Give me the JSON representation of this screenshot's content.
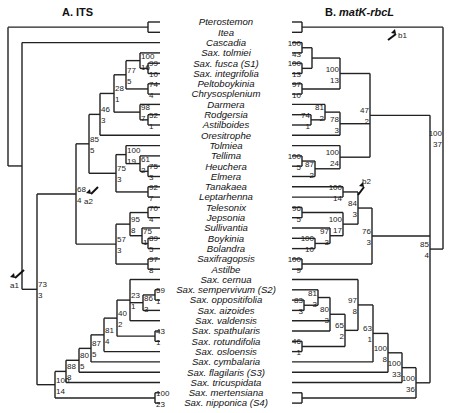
{
  "figure": {
    "panel_a_title": "A. ITS",
    "panel_b_title_prefix": "B. ",
    "panel_b_title_italic": "matK-rbcL",
    "arrows": {
      "a1": "a1",
      "a2": "a2",
      "b1": "b1",
      "b2": "b2"
    }
  },
  "taxa": [
    "Pterostemon",
    "Itea",
    "Cascadia",
    "Sax. tolmiei",
    "Sax. fusca (S1)",
    "Sax. integrifolia",
    "Peltoboykinia",
    "Chrysosplenium",
    "Darmera",
    "Rodgersia",
    "Astilboides",
    "Oresitrophe",
    "Tolmiea",
    "Tellima",
    "Heuchera",
    "Elmera",
    "Tanakaea",
    "Leptarhenna",
    "Telesonix",
    "Jepsonia",
    "Sullivantia",
    "Boykinia",
    "Bolandra",
    "Saxifragopsis",
    "Astilbe",
    "Sax. cernua",
    "Sax. sempervivum (S2)",
    "Sax. oppositifolia",
    "Sax. aizoides",
    "Sax. valdensis",
    "Sax. spathularis",
    "Sax. rotundifolia",
    "Sax. osloensis",
    "Sax. cymbalaria",
    "Sax. flagilaris (S3)",
    "Sax. tricuspidata",
    "Sax. mertensiana",
    "Sax. nipponica (S4)"
  ],
  "tree_a": {
    "segments": [
      [
        8,
        22,
        8,
        152
      ],
      [
        8,
        22,
        148,
        22
      ],
      [
        148,
        17,
        148,
        27
      ],
      [
        148,
        17,
        160,
        17
      ],
      [
        148,
        27,
        160,
        27
      ],
      [
        8,
        152,
        22,
        152
      ],
      [
        22,
        43,
        22,
        255
      ],
      [
        22,
        43,
        160,
        43
      ],
      [
        22,
        255,
        37,
        255
      ],
      [
        37,
        72,
        37,
        370
      ],
      [
        37,
        72,
        76,
        72
      ],
      [
        76,
        57,
        76,
        123
      ],
      [
        76,
        57,
        89,
        57
      ],
      [
        89,
        35,
        89,
        80
      ],
      [
        89,
        35,
        100,
        35
      ],
      [
        100,
        35,
        100,
        115
      ],
      [
        100,
        115,
        160,
        115
      ],
      [
        100,
        92,
        120,
        92
      ],
      [
        120,
        92,
        120,
        115
      ],
      [
        100,
        35,
        101,
        35
      ],
      [
        101,
        82,
        101,
        35
      ],
      [
        101,
        67,
        126,
        67
      ],
      [
        126,
        50,
        126,
        80
      ],
      [
        126,
        50,
        140,
        50
      ],
      [
        140,
        50,
        140,
        72
      ],
      [
        140,
        72,
        160,
        72
      ],
      [
        140,
        53,
        142,
        53
      ],
      [
        142,
        53,
        142,
        53
      ],
      [
        126,
        80,
        140,
        80
      ],
      [
        120,
        95,
        140,
        95
      ],
      [
        140,
        95,
        140,
        115
      ],
      [
        140,
        104,
        148,
        104
      ],
      [
        148,
        99,
        148,
        109
      ],
      [
        148,
        99,
        160,
        99
      ],
      [
        148,
        109,
        160,
        109
      ],
      [
        140,
        53,
        148,
        53
      ],
      [
        148,
        53,
        148,
        53
      ],
      [
        76,
        123,
        101,
        123
      ],
      [
        116,
        123,
        116,
        144
      ],
      [
        116,
        144,
        160,
        144
      ],
      [
        101,
        123,
        116,
        123
      ],
      [
        116,
        134,
        116,
        175
      ],
      [
        116,
        164,
        144,
        164
      ],
      [
        144,
        154,
        144,
        175
      ],
      [
        144,
        154,
        160,
        154
      ],
      [
        144,
        175,
        160,
        175
      ],
      [
        116,
        175,
        126,
        175
      ],
      [
        126,
        160,
        126,
        185
      ],
      [
        126,
        185,
        160,
        185
      ],
      [
        37,
        185,
        76,
        185
      ],
      [
        76,
        185,
        76,
        195
      ],
      [
        76,
        195,
        76,
        246
      ],
      [
        76,
        215,
        116,
        215
      ],
      [
        116,
        201,
        116,
        246
      ],
      [
        116,
        201,
        130,
        201
      ],
      [
        130,
        185,
        130,
        221
      ],
      [
        130,
        185,
        148,
        185
      ],
      [
        148,
        180,
        148,
        190
      ],
      [
        148,
        180,
        160,
        180
      ],
      [
        148,
        190,
        160,
        190
      ],
      [
        130,
        221,
        142,
        221
      ],
      [
        142,
        206,
        142,
        226
      ],
      [
        142,
        206,
        160,
        206
      ],
      [
        142,
        226,
        148,
        226
      ],
      [
        148,
        221,
        148,
        231
      ],
      [
        148,
        221,
        160,
        221
      ],
      [
        148,
        231,
        160,
        231
      ],
      [
        116,
        246,
        148,
        246
      ],
      [
        148,
        241,
        148,
        251
      ],
      [
        148,
        241,
        160,
        241
      ],
      [
        148,
        251,
        160,
        251
      ]
    ]
  },
  "labels_a": [
    {
      "x": 5,
      "y": 66,
      "t": "92",
      "u": true
    },
    {
      "x": 6,
      "y": 74,
      "t": "6"
    },
    {
      "x": 127,
      "y": 59,
      "t": "100"
    },
    {
      "x": 124,
      "y": 73,
      "t": "16"
    },
    {
      "x": 143,
      "y": 59,
      "t": "99"
    },
    {
      "x": 145,
      "y": 75,
      "t": "10"
    },
    {
      "x": 118,
      "y": 69,
      "t": "77"
    },
    {
      "x": 119,
      "y": 83,
      "t": "5"
    },
    {
      "x": 140,
      "y": 85,
      "t": "74"
    },
    {
      "x": 140,
      "y": 96,
      "t": "4"
    },
    {
      "x": 102,
      "y": 89,
      "t": "28"
    },
    {
      "x": 105,
      "y": 101,
      "t": "1"
    },
    {
      "x": 120,
      "y": 101,
      "t": "98"
    },
    {
      "x": 122,
      "y": 114,
      "t": "7"
    },
    {
      "x": 146,
      "y": 116,
      "t": "52"
    },
    {
      "x": 147,
      "y": 127,
      "t": "1"
    },
    {
      "x": 90,
      "y": 118,
      "t": "46"
    },
    {
      "x": 92,
      "y": 130,
      "t": "3"
    },
    {
      "x": 78,
      "y": 146,
      "t": "85"
    },
    {
      "x": 80,
      "y": 158,
      "t": "5"
    },
    {
      "x": 126,
      "y": 150,
      "t": "61"
    },
    {
      "x": 130,
      "y": 161,
      "t": "2"
    },
    {
      "x": 140,
      "y": 161,
      "t": "75"
    },
    {
      "x": 144,
      "y": 173,
      "t": "3"
    },
    {
      "x": 118,
      "y": 163,
      "t": "100"
    },
    {
      "x": 118,
      "y": 175,
      "t": "19"
    },
    {
      "x": 98,
      "y": 174,
      "t": "75"
    },
    {
      "x": 101,
      "y": 187,
      "t": "3"
    },
    {
      "x": 130,
      "y": 189,
      "t": "92"
    },
    {
      "x": 133,
      "y": 200,
      "t": "7"
    },
    {
      "x": 52,
      "y": 193,
      "t": "68"
    },
    {
      "x": 55,
      "y": 206,
      "t": "4"
    },
    {
      "x": 137,
      "y": 210,
      "t": "70"
    },
    {
      "x": 139,
      "y": 222,
      "t": "4"
    },
    {
      "x": 118,
      "y": 220,
      "t": "95"
    },
    {
      "x": 121,
      "y": 233,
      "t": "8"
    },
    {
      "x": 133,
      "y": 232,
      "t": "75"
    },
    {
      "x": 134,
      "y": 244,
      "t": "1"
    },
    {
      "x": 145,
      "y": 241,
      "t": "89"
    },
    {
      "x": 146,
      "y": 253,
      "t": "5"
    },
    {
      "x": 92,
      "y": 241,
      "t": "57"
    },
    {
      "x": 94,
      "y": 254,
      "t": "3"
    },
    {
      "x": 132,
      "y": 259,
      "t": "97"
    },
    {
      "x": 133,
      "y": 270,
      "t": "8"
    },
    {
      "x": 26,
      "y": 252,
      "t": "73"
    },
    {
      "x": 28,
      "y": 264,
      "t": "3"
    },
    {
      "x": 91,
      "y": 213,
      "t": "a2",
      "arrow": true
    },
    {
      "x": 4,
      "y": 286,
      "t": "a1",
      "arrow": true
    }
  ],
  "note": "layout computed in script"
}
